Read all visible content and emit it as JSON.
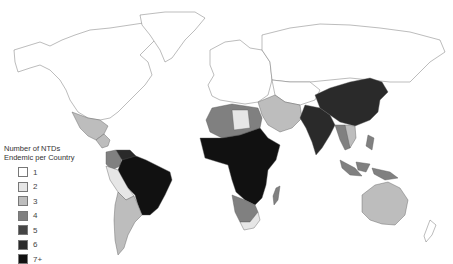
{
  "legend": {
    "title_line1": "Number of NTDs",
    "title_line2": "Endemic per Country",
    "items": [
      {
        "label": "1",
        "color": "#ffffff"
      },
      {
        "label": "2",
        "color": "#e6e6e6"
      },
      {
        "label": "3",
        "color": "#bdbdbd"
      },
      {
        "label": "4",
        "color": "#808080"
      },
      {
        "label": "5",
        "color": "#454545"
      },
      {
        "label": "6",
        "color": "#2a2a2a"
      },
      {
        "label": "7+",
        "color": "#111111"
      }
    ]
  },
  "map": {
    "type": "choropleth",
    "subject": "Number of neglected tropical diseases endemic per country",
    "regions": [
      {
        "name": "North America",
        "level": "1"
      },
      {
        "name": "Greenland",
        "level": "1"
      },
      {
        "name": "Mexico",
        "level": "3"
      },
      {
        "name": "Central America",
        "level": "3"
      },
      {
        "name": "Brazil",
        "level": "7+"
      },
      {
        "name": "Venezuela",
        "level": "6"
      },
      {
        "name": "Colombia",
        "level": "4"
      },
      {
        "name": "Bolivia / Peru",
        "level": "2"
      },
      {
        "name": "Argentina / Chile",
        "level": "3"
      },
      {
        "name": "Europe",
        "level": "1"
      },
      {
        "name": "Russia",
        "level": "1"
      },
      {
        "name": "North Africa",
        "level": "4"
      },
      {
        "name": "Sub-Saharan Africa",
        "level": "7+"
      },
      {
        "name": "Southern Africa",
        "level": "3"
      },
      {
        "name": "Madagascar",
        "level": "4"
      },
      {
        "name": "Middle East",
        "level": "3"
      },
      {
        "name": "India",
        "level": "6"
      },
      {
        "name": "China",
        "level": "6"
      },
      {
        "name": "Southeast Asia",
        "level": "4"
      },
      {
        "name": "Indonesia",
        "level": "4"
      },
      {
        "name": "Australia",
        "level": "3"
      },
      {
        "name": "New Zealand",
        "level": "1"
      }
    ]
  }
}
